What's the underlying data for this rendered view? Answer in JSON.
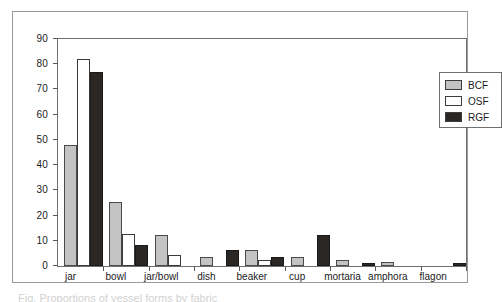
{
  "chart_data": {
    "type": "bar",
    "title": "",
    "xlabel": "",
    "ylabel": "",
    "ylim": [
      0,
      90
    ],
    "yticks": [
      0,
      10,
      20,
      30,
      40,
      50,
      60,
      70,
      80,
      90
    ],
    "grid": false,
    "legend_position": "top-right",
    "categories": [
      "jar",
      "bowl",
      "jar/bowl",
      "dish",
      "beaker",
      "cup",
      "mortaria",
      "amphora",
      "flagon"
    ],
    "series": [
      {
        "name": "BCF",
        "color": "#c3c3c3",
        "values": [
          48,
          25.3,
          12.3,
          3.4,
          6.4,
          3.4,
          2.4,
          1.6,
          0
        ]
      },
      {
        "name": "OSF",
        "color": "#ffffff",
        "values": [
          82,
          12.5,
          4.4,
          0,
          2.4,
          0,
          0,
          0,
          0
        ]
      },
      {
        "name": "RGF",
        "color": "#2a2724",
        "values": [
          77,
          8.5,
          0,
          6.4,
          3.4,
          12.2,
          1.1,
          0,
          1.3
        ]
      }
    ]
  },
  "legend": {
    "entries": [
      {
        "label": "BCF",
        "swatch": "bcf"
      },
      {
        "label": "OSF",
        "swatch": "osf"
      },
      {
        "label": "RGF",
        "swatch": "rgf"
      }
    ]
  },
  "caption": {
    "text": "Fig. Proportions of vessel forms by fabric"
  }
}
